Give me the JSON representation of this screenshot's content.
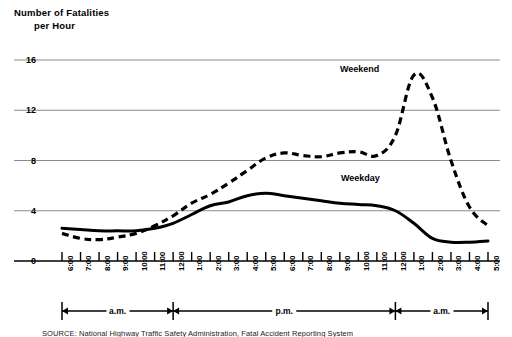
{
  "title": {
    "line1": "Number of Fatalities",
    "line2": "per Hour"
  },
  "source": {
    "text": "SOURCE: National Highway Traffic Safety Administration, Fatal Accident Reporting System"
  },
  "annotations": {
    "weekend": "Weekend",
    "weekday": "Weekday"
  },
  "periods": [
    {
      "label": "a.m."
    },
    {
      "label": "p.m."
    },
    {
      "label": "a.m."
    }
  ],
  "colors": {
    "line": "#000000",
    "grid": "#8a8a8a",
    "axis": "#000000",
    "background": "#ffffff"
  },
  "chart_data": {
    "type": "line",
    "title": "Number of Fatalities per Hour",
    "xlabel": "",
    "ylabel": "Number of Fatalities per Hour",
    "ylim": [
      0,
      17.2
    ],
    "yticks": [
      0,
      4,
      8,
      12,
      16
    ],
    "grid": true,
    "legend": "inline-annotations",
    "categories": [
      "6:00",
      "7:00",
      "8:00",
      "9:00",
      "10:00",
      "11:00",
      "12:00",
      "1:00",
      "2:00",
      "3:00",
      "4:00",
      "5:00",
      "6:00",
      "7:00",
      "8:00",
      "9:00",
      "10:00",
      "11:00",
      "12:00",
      "1:00",
      "2:00",
      "3:00",
      "4:00",
      "5:00"
    ],
    "period_spans": [
      {
        "label": "a.m.",
        "from": "6:00",
        "to": "12:00"
      },
      {
        "label": "p.m.",
        "from": "12:00",
        "to": "12:00"
      },
      {
        "label": "a.m.",
        "from": "12:00",
        "to": "5:00"
      }
    ],
    "series": [
      {
        "name": "Weekday",
        "style": "solid",
        "values": [
          2.6,
          2.5,
          2.4,
          2.4,
          2.4,
          2.6,
          3.0,
          3.7,
          4.4,
          4.7,
          5.2,
          5.4,
          5.2,
          5.0,
          4.8,
          4.6,
          4.5,
          4.4,
          4.0,
          3.0,
          1.8,
          1.5,
          1.5,
          1.6
        ]
      },
      {
        "name": "Weekend",
        "style": "dashed",
        "values": [
          2.2,
          1.8,
          1.7,
          1.9,
          2.2,
          2.8,
          3.6,
          4.6,
          5.3,
          6.2,
          7.2,
          8.2,
          8.6,
          8.4,
          8.3,
          8.6,
          8.7,
          8.4,
          10.0,
          14.8,
          13.0,
          8.0,
          4.3,
          2.8
        ]
      }
    ]
  }
}
